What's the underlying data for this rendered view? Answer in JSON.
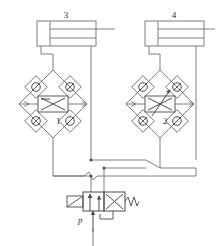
{
  "diagram": {
    "kind": "hydraulic-schematic",
    "colors": {
      "line": "#6f6f6f",
      "line_dark": "#4a4a4a",
      "label": "#2b2b2b",
      "background": "#ffffff"
    }
  },
  "components": {
    "cylinder_left": {
      "label": "3",
      "name": "hydraulic-cylinder-3"
    },
    "cylinder_right": {
      "label": "4",
      "name": "hydraulic-cylinder-4"
    },
    "bridge_left": {
      "label": "1",
      "name": "check-valve-bridge-1",
      "center_valve": "throttle-valve",
      "check_valve_count": 4
    },
    "bridge_right": {
      "label": "2",
      "name": "check-valve-bridge-2",
      "center_valve": "adjustable-throttle-valve",
      "check_valve_count": 4
    },
    "directional_valve": {
      "name": "directional-control-valve",
      "positions": 2,
      "actuator_left": "lever",
      "actuator_right": "spring-return"
    }
  },
  "labels": {
    "cylinder_left_number": "3",
    "cylinder_right_number": "4",
    "bridge_left_number": "1",
    "bridge_right_number": "2",
    "pressure_port": "p"
  }
}
